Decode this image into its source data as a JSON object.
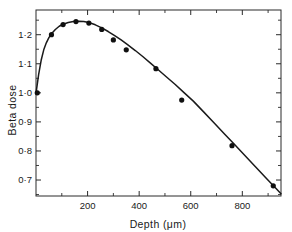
{
  "chart_data": {
    "type": "line",
    "title": "",
    "subtitle": "",
    "xlabel": "Depth (μm)",
    "ylabel": "Beta dose",
    "xlim": [
      0,
      950
    ],
    "ylim": [
      0.645,
      1.285
    ],
    "grid": false,
    "legend": "none",
    "decimal_separator": "middle-dot",
    "x_ticks_major": [
      200,
      400,
      600,
      800
    ],
    "x_tick_labels": [
      "200",
      "400",
      "600",
      "800"
    ],
    "x_ticks_minor": [
      100,
      300,
      500,
      700,
      900
    ],
    "y_ticks_major": [
      0.7,
      0.8,
      0.9,
      1.0,
      1.1,
      1.2
    ],
    "y_tick_labels": [
      "0·7",
      "0·8",
      "0·9",
      "1·0",
      "1·1",
      "1·2"
    ],
    "y_ticks_minor": [
      0.65,
      0.75,
      0.85,
      0.95,
      1.05,
      1.15,
      1.25
    ],
    "series": [
      {
        "name": "Beta dose vs depth",
        "marker": "filled-circle",
        "marker_color": "#101010",
        "line_color": "#1a1a1a",
        "x": [
          5,
          60,
          105,
          155,
          205,
          255,
          300,
          350,
          465,
          565,
          760,
          920
        ],
        "y": [
          1.0,
          1.2,
          1.235,
          1.245,
          1.24,
          1.218,
          1.182,
          1.148,
          1.083,
          0.975,
          0.818,
          0.68
        ]
      }
    ],
    "fitted_curve": {
      "name": "fitted-curve",
      "x": [
        0,
        10,
        20,
        30,
        40,
        50,
        60,
        75,
        90,
        105,
        125,
        145,
        165,
        185,
        205,
        230,
        255,
        280,
        305,
        330,
        355,
        385,
        415,
        445,
        475,
        505,
        540,
        575,
        610,
        650,
        690,
        730,
        770,
        810,
        850,
        890,
        930,
        950
      ],
      "y": [
        0.998,
        1.062,
        1.112,
        1.148,
        1.172,
        1.19,
        1.203,
        1.218,
        1.229,
        1.236,
        1.242,
        1.2455,
        1.2465,
        1.2455,
        1.242,
        1.234,
        1.2235,
        1.211,
        1.197,
        1.182,
        1.166,
        1.1455,
        1.124,
        1.1015,
        1.0785,
        1.0555,
        1.0285,
        1.0,
        0.9715,
        0.9345,
        0.897,
        0.8595,
        0.822,
        0.784,
        0.7465,
        0.709,
        0.6715,
        0.653
      ]
    }
  },
  "axis_titles": {
    "x": "Depth (μm)",
    "y": "Beta dose"
  }
}
